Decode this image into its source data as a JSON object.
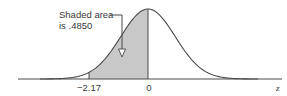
{
  "chart_data": {
    "type": "area",
    "title": "",
    "distribution": "standard normal",
    "xlabel": "z",
    "ylabel": "",
    "x_ticks": [
      {
        "value": -2.17,
        "label": "−2.17"
      },
      {
        "value": 0,
        "label": "0"
      }
    ],
    "shaded_region": {
      "from": -2.17,
      "to": 0,
      "area": 0.485
    },
    "annotation": {
      "line1": "Shaded area",
      "line2": "is .4850"
    },
    "xlim": [
      -3.4,
      3.4
    ],
    "grid": false,
    "legend": null
  },
  "colors": {
    "curve": "#4a4a4a",
    "shade": "#c8c8c8",
    "text": "#3a3a3a"
  }
}
